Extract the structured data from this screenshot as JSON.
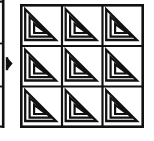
{
  "figure": {
    "title": "Nested triangle 3x3 matrix figure",
    "type": "geometric-pattern-matrix",
    "background_color": "#ffffff",
    "ink_color": "#111111"
  },
  "matrix": {
    "rows": 3,
    "columns": 3,
    "bounds": {
      "x": 20,
      "y": 4,
      "width": 124,
      "height": 124
    },
    "outer_border_width": 2.6,
    "cell_divider_width": 2.2,
    "cells": [
      {
        "row": 1,
        "col": 1,
        "label": "cell-r1c1",
        "pattern": "nested-triangle",
        "nest_count": 3,
        "right_angle_corner": "bottom-left",
        "hypotenuse": "top-left-to-bottom-right"
      },
      {
        "row": 1,
        "col": 2,
        "label": "cell-r1c2",
        "pattern": "nested-triangle",
        "nest_count": 3,
        "right_angle_corner": "bottom-left",
        "hypotenuse": "top-left-to-bottom-right"
      },
      {
        "row": 1,
        "col": 3,
        "label": "cell-r1c3",
        "pattern": "nested-triangle",
        "nest_count": 3,
        "right_angle_corner": "bottom-left",
        "hypotenuse": "top-left-to-bottom-right"
      },
      {
        "row": 2,
        "col": 1,
        "label": "cell-r2c1",
        "pattern": "nested-triangle",
        "nest_count": 3,
        "right_angle_corner": "bottom-left",
        "hypotenuse": "top-left-to-bottom-right"
      },
      {
        "row": 2,
        "col": 2,
        "label": "cell-r2c2",
        "pattern": "nested-triangle",
        "nest_count": 3,
        "right_angle_corner": "bottom-left",
        "hypotenuse": "top-left-to-bottom-right"
      },
      {
        "row": 2,
        "col": 3,
        "label": "cell-r2c3",
        "pattern": "nested-triangle",
        "nest_count": 3,
        "right_angle_corner": "bottom-left",
        "hypotenuse": "top-left-to-bottom-right"
      },
      {
        "row": 3,
        "col": 1,
        "label": "cell-r3c1",
        "pattern": "nested-triangle",
        "nest_count": 3,
        "right_angle_corner": "bottom-left",
        "hypotenuse": "top-left-to-bottom-right"
      },
      {
        "row": 3,
        "col": 2,
        "label": "cell-r3c2",
        "pattern": "nested-triangle",
        "nest_count": 3,
        "right_angle_corner": "bottom-left",
        "hypotenuse": "top-left-to-bottom-right"
      },
      {
        "row": 3,
        "col": 3,
        "label": "cell-r3c3",
        "pattern": "nested-triangle",
        "nest_count": 3,
        "right_angle_corner": "bottom-left",
        "hypotenuse": "top-left-to-bottom-right"
      }
    ]
  },
  "marker": {
    "name": "diamond-pointer",
    "shape": "filled-diamond",
    "color": "#111111",
    "position": {
      "x": 9.5,
      "y": 63.5
    },
    "width": 6,
    "height": 13
  },
  "cropped_left_panel": {
    "name": "cropped-neighbor-figure",
    "description": "Right edge of an adjacent figure cut off by the crop",
    "edge_x": 2.5,
    "top": 0,
    "bottom": 128,
    "stroke_width": 2.4
  }
}
